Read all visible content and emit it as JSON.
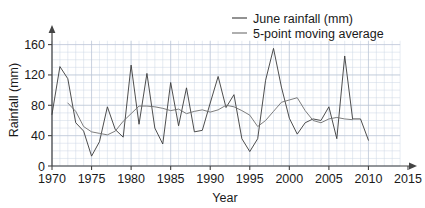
{
  "chart_data": {
    "type": "line",
    "title": "",
    "xlabel": "Year",
    "ylabel": "Rainfall (mm)",
    "xlim": [
      1970,
      2015
    ],
    "ylim": [
      0,
      170
    ],
    "xticks": [
      1970,
      1975,
      1980,
      1985,
      1990,
      1995,
      2000,
      2005,
      2010,
      2015
    ],
    "yticks": [
      0,
      40,
      80,
      120,
      160
    ],
    "grid": true,
    "grid_minor_x_step": 1,
    "grid_minor_y_step": 10,
    "legend_position": "top-right",
    "x": [
      1970,
      1971,
      1972,
      1973,
      1974,
      1975,
      1976,
      1977,
      1978,
      1979,
      1980,
      1981,
      1982,
      1983,
      1984,
      1985,
      1986,
      1987,
      1988,
      1989,
      1990,
      1991,
      1992,
      1993,
      1994,
      1995,
      1996,
      1997,
      1998,
      1999,
      2000,
      2001,
      2002,
      2003,
      2004,
      2005,
      2006,
      2007,
      2008,
      2009,
      2010
    ],
    "series": [
      {
        "name": "June rainfall (mm)",
        "color": "#3a3a3a",
        "values": [
          68,
          131,
          115,
          57,
          46,
          13,
          32,
          78,
          48,
          38,
          133,
          55,
          122,
          50,
          29,
          110,
          53,
          103,
          45,
          47,
          83,
          118,
          77,
          94,
          36,
          19,
          36,
          113,
          155,
          104,
          63,
          42,
          57,
          62,
          60,
          78,
          36,
          145,
          62,
          62,
          34
        ]
      },
      {
        "name": "5-point moving average",
        "color": "#6e6e6e",
        "values": [
          null,
          null,
          83,
          72,
          52,
          45,
          43,
          41,
          46,
          59,
          69,
          79,
          79,
          78,
          76,
          73,
          75,
          69,
          72,
          74,
          71,
          74,
          80,
          78,
          73,
          67,
          52,
          60,
          72,
          84,
          87,
          90,
          73,
          60,
          57,
          62,
          64,
          62,
          61,
          null,
          null
        ]
      }
    ]
  },
  "legend": {
    "items": [
      {
        "label": "June rainfall (mm)",
        "color": "#3a3a3a"
      },
      {
        "label": "5-point moving average",
        "color": "#6e6e6e"
      }
    ]
  },
  "axes": {
    "x_title": "Year",
    "y_title": "Rainfall (mm)",
    "x_tick_labels": [
      "1970",
      "1975",
      "1980",
      "1985",
      "1990",
      "1995",
      "2000",
      "2005",
      "2010",
      "2015"
    ],
    "y_tick_labels": [
      "0",
      "40",
      "80",
      "120",
      "160"
    ]
  }
}
